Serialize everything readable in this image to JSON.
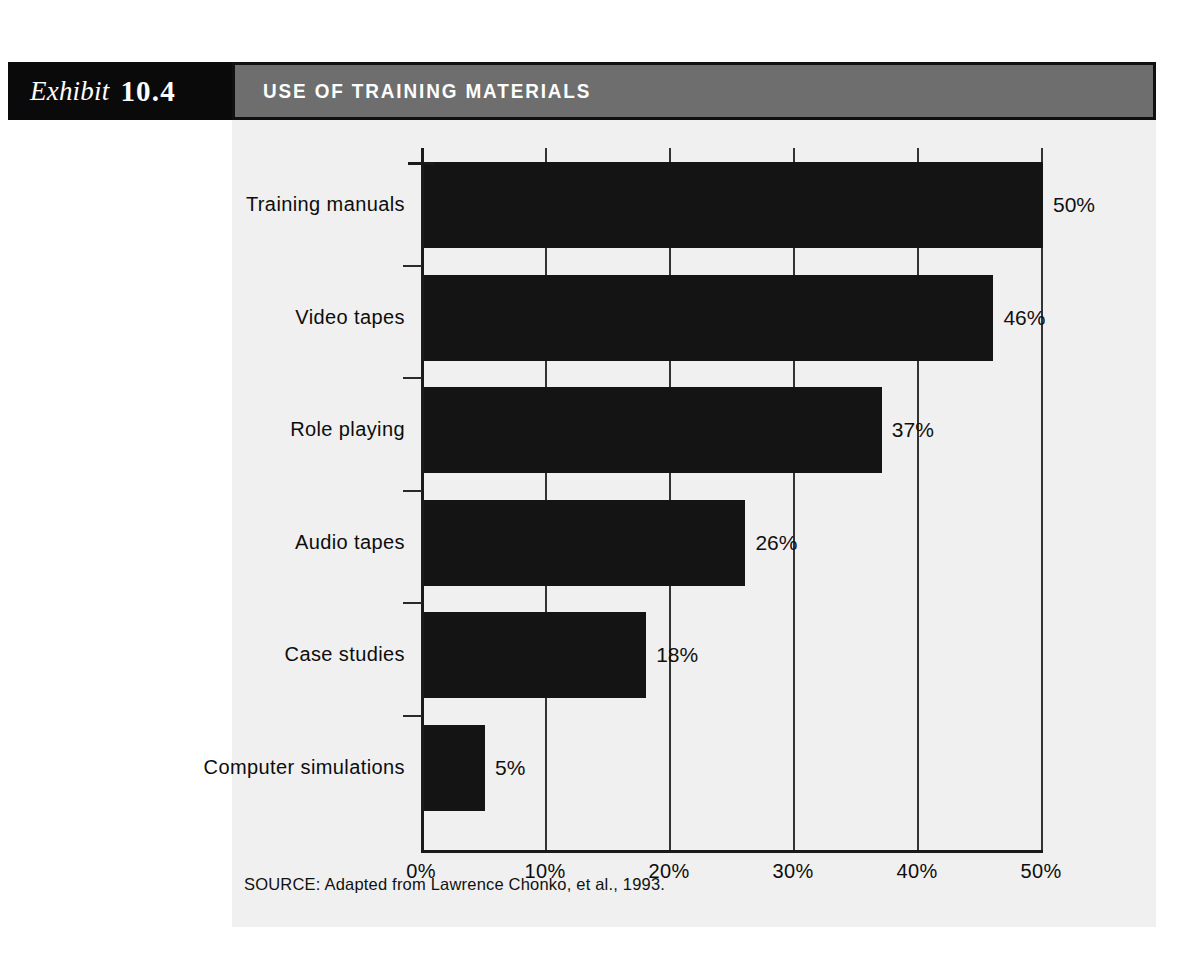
{
  "exhibit": {
    "label": "Exhibit",
    "number": "10.4",
    "title": "USE OF TRAINING MATERIALS"
  },
  "source": {
    "note": "SOURCE: Adapted from Lawrence Chonko, et al., 1993."
  },
  "colors": {
    "exhibit_bar": "#0a0a0a",
    "title_bar": "#6e6e6e",
    "panel": "#f0f0f0",
    "bar_fill": "#141414",
    "axis": "#1a1a1a"
  },
  "chart_data": {
    "type": "bar",
    "orientation": "horizontal",
    "title": "USE OF TRAINING MATERIALS",
    "xlabel": "",
    "ylabel": "",
    "xlim": [
      0,
      50
    ],
    "grid": true,
    "legend": "none",
    "categories": [
      "Training manuals",
      "Video tapes",
      "Role playing",
      "Audio tapes",
      "Case studies",
      "Computer simulations"
    ],
    "values": [
      50,
      46,
      37,
      26,
      18,
      5
    ],
    "value_labels": [
      "50%",
      "46%",
      "37%",
      "26%",
      "18%",
      "5%"
    ],
    "xticks": [
      0,
      10,
      20,
      30,
      40,
      50
    ],
    "xtick_labels": [
      "0%",
      "10%",
      "20%",
      "30%",
      "40%",
      "50%"
    ]
  }
}
